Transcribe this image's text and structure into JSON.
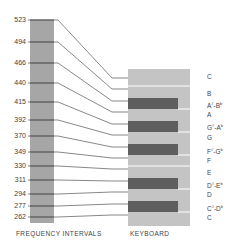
{
  "diagram": {
    "left_caption": "FREQUENCY INTERVALS",
    "right_caption": "KEYBOARD",
    "colors": {
      "frequency_bar": "#a6a6a6",
      "keyboard_white": "#c4c4c4",
      "keyboard_black": "#5e5e5e",
      "lines": "#555555",
      "separator": "#ffffff"
    },
    "frequencies": [
      {
        "value": "523",
        "label_y": 16,
        "key_y": 78
      },
      {
        "value": "494",
        "label_y": 38,
        "key_y": 89
      },
      {
        "value": "466",
        "label_y": 59,
        "key_y": 101
      },
      {
        "value": "440",
        "label_y": 79,
        "key_y": 112
      },
      {
        "value": "415",
        "label_y": 98,
        "key_y": 124
      },
      {
        "value": "392",
        "label_y": 116,
        "key_y": 135
      },
      {
        "value": "370",
        "label_y": 132,
        "key_y": 147
      },
      {
        "value": "349",
        "label_y": 148,
        "key_y": 158
      },
      {
        "value": "330",
        "label_y": 162,
        "key_y": 169
      },
      {
        "value": "311",
        "label_y": 176,
        "key_y": 181
      },
      {
        "value": "294",
        "label_y": 190,
        "key_y": 192
      },
      {
        "value": "277",
        "label_y": 202,
        "key_y": 204
      },
      {
        "value": "262",
        "label_y": 213,
        "key_y": 215
      }
    ],
    "keys": [
      {
        "note": "C",
        "base": "C",
        "sup": "",
        "base2": "",
        "sup2": "",
        "y": 76
      },
      {
        "note": "B",
        "base": "B",
        "sup": "",
        "base2": "",
        "sup2": "",
        "y": 93
      },
      {
        "note": "A#-Bb",
        "base": "A",
        "sup": "#",
        "base2": "-B",
        "sup2": "b",
        "y": 103
      },
      {
        "note": "A",
        "base": "A",
        "sup": "",
        "base2": "",
        "sup2": "",
        "y": 114
      },
      {
        "note": "G#-Ab",
        "base": "G",
        "sup": "#",
        "base2": "-A",
        "sup2": "b",
        "y": 125
      },
      {
        "note": "G",
        "base": "G",
        "sup": "",
        "base2": "",
        "sup2": "",
        "y": 137
      },
      {
        "note": "F#-Gb",
        "base": "F",
        "sup": "#",
        "base2": "-G",
        "sup2": "b",
        "y": 149
      },
      {
        "note": "F",
        "base": "F",
        "sup": "",
        "base2": "",
        "sup2": "",
        "y": 160
      },
      {
        "note": "E",
        "base": "E",
        "sup": "",
        "base2": "",
        "sup2": "",
        "y": 172
      },
      {
        "note": "D#-Eb",
        "base": "D",
        "sup": "#",
        "base2": "-E",
        "sup2": "b",
        "y": 183
      },
      {
        "note": "D",
        "base": "D",
        "sup": "",
        "base2": "",
        "sup2": "",
        "y": 194
      },
      {
        "note": "C#-Db",
        "base": "C",
        "sup": "#",
        "base2": "-D",
        "sup2": "b",
        "y": 206
      },
      {
        "note": "C",
        "base": "C",
        "sup": "",
        "base2": "",
        "sup2": "",
        "y": 217
      }
    ],
    "black_keys": [
      {
        "note": "A#-Bb",
        "y": 98,
        "h": 11
      },
      {
        "note": "G#-Ab",
        "y": 121,
        "h": 11
      },
      {
        "note": "F#-Gb",
        "y": 144,
        "h": 11
      },
      {
        "note": "D#-Eb",
        "y": 178,
        "h": 11
      },
      {
        "note": "C#-Db",
        "y": 201,
        "h": 11
      }
    ],
    "white_separators": [
      {
        "between": "C-B",
        "y": 86
      },
      {
        "between": "E-F",
        "y": 166
      },
      {
        "between": "A#-A",
        "y": 109
      },
      {
        "between": "G#-G",
        "y": 132
      },
      {
        "between": "F#-F",
        "y": 155
      },
      {
        "between": "D#-D",
        "y": 189
      },
      {
        "between": "C#-C",
        "y": 212
      }
    ]
  }
}
